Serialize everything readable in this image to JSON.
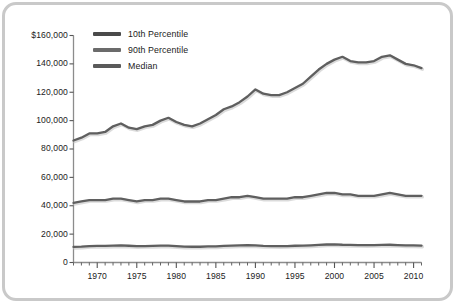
{
  "frame": {
    "border_color": "#c9c9c9",
    "background": "#ffffff"
  },
  "legend": {
    "position": "inside-top-left",
    "entries": [
      {
        "label": "10th Percentile",
        "color": "#4a4a4a"
      },
      {
        "label": "90th Percentile",
        "color": "#6b6b6b"
      },
      {
        "label": "Median",
        "color": "#5a5a5a"
      }
    ]
  },
  "axes": {
    "y_ticks": [
      "$160,000",
      "140,000",
      "120,000",
      "100,000",
      "80,000",
      "60,000",
      "40,000",
      "20,000",
      "0"
    ],
    "x_ticks": [
      "1970",
      "1975",
      "1980",
      "1985",
      "1990",
      "1995",
      "2000",
      "2005",
      "2010"
    ],
    "axis_color": "#8c8c8c",
    "tick_color": "#555555"
  },
  "chart_data": {
    "type": "line",
    "title": "",
    "xlabel": "",
    "ylabel": "",
    "xlim": [
      1967,
      2011
    ],
    "ylim": [
      0,
      160000
    ],
    "ytick_step": 20000,
    "xtick_step_minor": 1,
    "xtick_step_major": 5,
    "grid": false,
    "legend_position": "inside-top-left",
    "x": [
      1967,
      1968,
      1969,
      1970,
      1971,
      1972,
      1973,
      1974,
      1975,
      1976,
      1977,
      1978,
      1979,
      1980,
      1981,
      1982,
      1983,
      1984,
      1985,
      1986,
      1987,
      1988,
      1989,
      1990,
      1991,
      1992,
      1993,
      1994,
      1995,
      1996,
      1997,
      1998,
      1999,
      2000,
      2001,
      2002,
      2003,
      2004,
      2005,
      2006,
      2007,
      2008,
      2009,
      2010,
      2011
    ],
    "series": [
      {
        "name": "90th Percentile",
        "color": "#5f5f5f",
        "values": [
          86000,
          88000,
          91000,
          91000,
          92000,
          96000,
          98000,
          95000,
          94000,
          96000,
          97000,
          100000,
          102000,
          99000,
          97000,
          96000,
          98000,
          101000,
          104000,
          108000,
          110000,
          113000,
          117000,
          122000,
          119000,
          118000,
          118000,
          120000,
          123000,
          126000,
          131000,
          136000,
          140000,
          143000,
          145000,
          142000,
          141000,
          141000,
          142000,
          145000,
          146000,
          143000,
          140000,
          139000,
          137000
        ]
      },
      {
        "name": "Median",
        "color": "#5f5f5f",
        "values": [
          42000,
          43000,
          44000,
          44000,
          44000,
          45000,
          45000,
          44000,
          43000,
          44000,
          44000,
          45000,
          45000,
          44000,
          43000,
          43000,
          43000,
          44000,
          44000,
          45000,
          46000,
          46000,
          47000,
          46000,
          45000,
          45000,
          45000,
          45000,
          46000,
          46000,
          47000,
          48000,
          49000,
          49000,
          48000,
          48000,
          47000,
          47000,
          47000,
          48000,
          49000,
          48000,
          47000,
          47000,
          47000
        ]
      },
      {
        "name": "10th Percentile",
        "color": "#5f5f5f",
        "values": [
          11000,
          11200,
          11600,
          11700,
          11700,
          11900,
          12000,
          11800,
          11500,
          11600,
          11700,
          11900,
          11900,
          11500,
          11200,
          11100,
          11100,
          11300,
          11400,
          11700,
          11900,
          12000,
          12200,
          12000,
          11700,
          11600,
          11500,
          11600,
          11800,
          11900,
          12100,
          12400,
          12700,
          12800,
          12500,
          12400,
          12300,
          12200,
          12300,
          12400,
          12500,
          12300,
          12100,
          12000,
          11900
        ]
      }
    ]
  }
}
